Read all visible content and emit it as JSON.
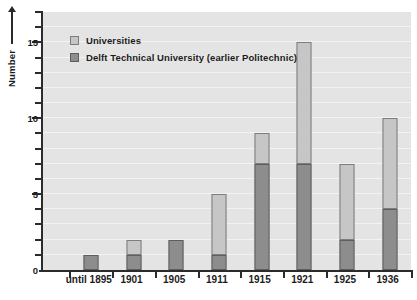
{
  "chart_data": {
    "type": "bar",
    "subtype": "stacked-bar",
    "title": "",
    "xlabel": "",
    "ylabel": "Number",
    "ylim": [
      0,
      17
    ],
    "yticks": [
      0,
      5,
      10,
      15
    ],
    "ytick_labels": [
      "0",
      "5",
      "10",
      "15"
    ],
    "minor_tick_interval": 1,
    "grid": true,
    "grid_axis": "y",
    "legend_position": "top-left",
    "categories": [
      "until 1895",
      "1901",
      "1905",
      "1911",
      "1915",
      "1921",
      "1925",
      "1936"
    ],
    "series": [
      {
        "name": "Delft Technical University (earlier Politechnic)",
        "color": "#8d8d8d",
        "values": [
          1,
          1,
          2,
          1,
          7,
          7,
          2,
          4
        ]
      },
      {
        "name": "Universities",
        "color": "#c6c6c6",
        "values": [
          0,
          1,
          0,
          4,
          2,
          8,
          5,
          6
        ]
      }
    ],
    "totals": [
      1,
      2,
      2,
      5,
      9,
      15,
      7,
      10
    ]
  },
  "axis": {
    "y_title": "Number",
    "y_labels": [
      "15",
      "10",
      "5",
      "0"
    ]
  },
  "legend": {
    "items": [
      {
        "label": "Universities",
        "swatch": "light"
      },
      {
        "label": "Delft Technical University (earlier Politechnic)",
        "swatch": "dark"
      }
    ]
  },
  "colors": {
    "universities": "#c6c6c6",
    "delft": "#8d8d8d",
    "plot_background": "#e4e4e4",
    "axis": "#2b2b2b"
  }
}
